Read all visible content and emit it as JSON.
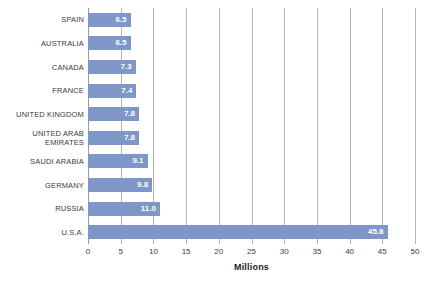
{
  "chart_data": {
    "type": "bar",
    "orientation": "horizontal",
    "title": "",
    "subtitle": "",
    "xlabel": "Millions",
    "ylabel": "",
    "xlim": [
      0,
      50
    ],
    "xticks": [
      0,
      5,
      10,
      15,
      20,
      25,
      30,
      35,
      40,
      45,
      50
    ],
    "xtick_labels": [
      "0",
      "5",
      "10",
      "15",
      "20",
      "25",
      "30",
      "35",
      "40",
      "45",
      "50"
    ],
    "grid": true,
    "grid_axis": "x",
    "legend": false,
    "legend_position": "none",
    "bar_color": "#7e97c8",
    "gridline_color": "#b5b5b5",
    "value_label_color": "#ffffff",
    "background_color": "#ffffff",
    "categories": [
      "SPAIN",
      "AUSTRALIA",
      "CANADA",
      "FRANCE",
      "UNITED KINGDOM",
      "UNITED ARAB\nEMIRATES",
      "SAUDI ARABIA",
      "GERMANY",
      "RUSSIA",
      "U.S.A."
    ],
    "values": [
      6.5,
      6.5,
      7.3,
      7.4,
      7.8,
      7.8,
      9.1,
      9.8,
      11.0,
      45.8
    ],
    "value_labels": [
      "6.5",
      "6.5",
      "7.3",
      "7.4",
      "7.8",
      "7.8",
      "9.1",
      "9.8",
      "11.0",
      "45.8"
    ]
  }
}
